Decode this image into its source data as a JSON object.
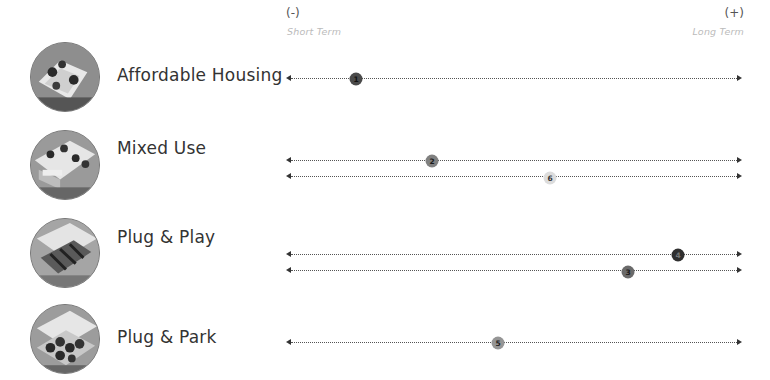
{
  "scale": {
    "left_symbol": "(-)",
    "left_label": "Short Term",
    "right_symbol": "(+)",
    "right_label": "Long Term"
  },
  "rows": [
    {
      "label": "Affordable Housing",
      "icon": "aerial-housing-thumbnail",
      "tracks": [
        {
          "marker": "1",
          "position_pct": 15.4,
          "fill": "#4a4a4a",
          "text_color": "#111111"
        }
      ]
    },
    {
      "label": "Mixed Use",
      "icon": "aerial-mixed-use-thumbnail",
      "tracks": [
        {
          "marker": "2",
          "position_pct": 32.0,
          "fill": "#808080",
          "text_color": "#1a1a1a"
        },
        {
          "marker": "6",
          "position_pct": 58.0,
          "fill": "#dcdcdc",
          "text_color": "#333333"
        }
      ]
    },
    {
      "label": "Plug & Play",
      "icon": "aerial-plug-play-thumbnail",
      "tracks": [
        {
          "marker": "4",
          "position_pct": 86.0,
          "fill": "#2f2f2f",
          "text_color": "#777777"
        },
        {
          "marker": "3",
          "position_pct": 75.0,
          "fill": "#6a6a6a",
          "text_color": "#1a1a1a"
        }
      ]
    },
    {
      "label": "Plug & Park",
      "icon": "aerial-plug-park-thumbnail",
      "tracks": [
        {
          "marker": "5",
          "position_pct": 46.5,
          "fill": "#959595",
          "text_color": "#222222"
        }
      ]
    }
  ]
}
